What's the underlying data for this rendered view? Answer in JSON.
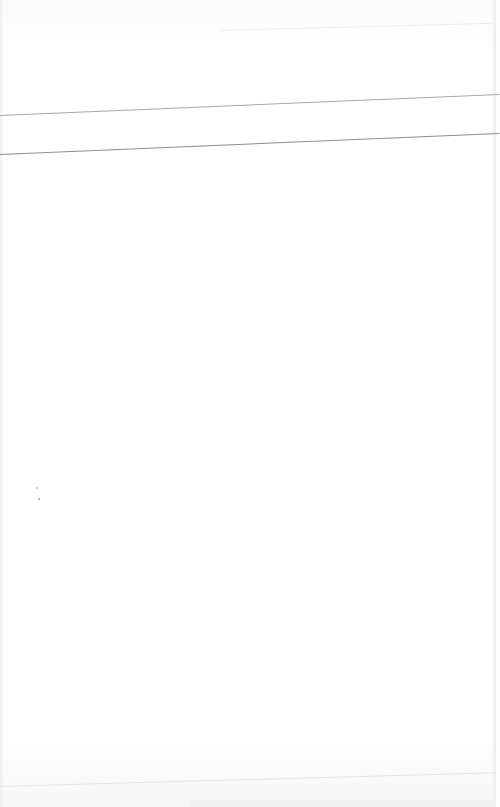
{
  "document": {
    "type": "blank-paper-sheet",
    "title": "",
    "text": "",
    "ruled_lines": 2
  },
  "colors": {
    "paper": "#fefefe",
    "rule_light": "#a9a9a9",
    "rule_dark": "#8e8e8e"
  }
}
